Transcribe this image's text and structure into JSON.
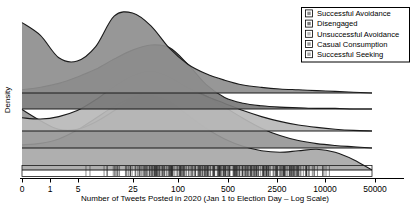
{
  "chart_data": {
    "type": "area",
    "subtype": "ridgeline-joyplot",
    "title": "",
    "xlabel": "Number of Tweets Posted in 2020 (Jan 1 to Election Day – Log Scale)",
    "ylabel": "Density",
    "grid": false,
    "legend_position": "top-right",
    "x_scale": "log",
    "x_tick_labels": [
      "0",
      "1",
      "5",
      "25",
      "100",
      "500",
      "2500",
      "10000",
      "50000"
    ],
    "x_tick_values": [
      0,
      1,
      5,
      25,
      100,
      500,
      2500,
      10000,
      50000
    ],
    "x_tick_px": [
      22,
      50,
      78,
      133,
      178,
      228,
      277,
      325,
      375
    ],
    "series": [
      {
        "name": "Successful Avoidance",
        "color": "#8e8e8e",
        "baseline_px": 93,
        "peak_labels": [
          "0",
          "5"
        ],
        "description": "Bimodal: tall mode at 0 tweets, taller mode near 5 tweets, long thin right tail past 500",
        "values": [
          0.88,
          0.72,
          0.44,
          0.4,
          0.58,
          0.96,
          1.0,
          0.84,
          0.56,
          0.36,
          0.24,
          0.16,
          0.1,
          0.07,
          0.05,
          0.04,
          0.03,
          0.02,
          0.01,
          0.0
        ]
      },
      {
        "name": "Disengaged",
        "color": "#7a7a7a",
        "baseline_px": 109,
        "peak_labels": [
          "25"
        ],
        "description": "Broad single mode rising from 0 to a peak near 20-25 tweets then falling to near zero by 200",
        "values": [
          0.3,
          0.34,
          0.4,
          0.5,
          0.62,
          0.78,
          0.92,
          1.0,
          0.96,
          0.7,
          0.38,
          0.18,
          0.09,
          0.05,
          0.03,
          0.02,
          0.01,
          0.01,
          0.0,
          0.0
        ]
      },
      {
        "name": "Unsuccessful Avoidance",
        "color": "#b9b9b9",
        "baseline_px": 131,
        "peak_labels": [
          "25"
        ],
        "description": "Low flat start, wide plateau peaking near 25, slow decay with a shoulder to 1000",
        "values": [
          0.22,
          0.2,
          0.24,
          0.34,
          0.52,
          0.74,
          0.92,
          1.0,
          0.9,
          0.72,
          0.58,
          0.46,
          0.34,
          0.24,
          0.16,
          0.1,
          0.06,
          0.03,
          0.01,
          0.0
        ]
      },
      {
        "name": "Casual Consumption",
        "color": "#979797",
        "baseline_px": 148,
        "peak_labels": [
          "0",
          "100"
        ],
        "description": "Mode at 0, dip near 3, broad second mode around 80-200, long tail to 5000",
        "values": [
          0.62,
          0.44,
          0.3,
          0.3,
          0.42,
          0.6,
          0.8,
          0.94,
          1.0,
          0.96,
          0.84,
          0.66,
          0.48,
          0.32,
          0.2,
          0.12,
          0.07,
          0.04,
          0.02,
          0.0
        ]
      },
      {
        "name": "Successful Seeking",
        "color": "#a8a8a8",
        "baseline_px": 170,
        "peak_labels": [
          "25",
          "5000"
        ],
        "description": "Rises to a mode near 25-50, declines through 500, small secondary bump near 5000",
        "values": [
          0.34,
          0.36,
          0.42,
          0.54,
          0.7,
          0.86,
          0.98,
          1.0,
          0.92,
          0.74,
          0.56,
          0.42,
          0.32,
          0.26,
          0.24,
          0.26,
          0.28,
          0.24,
          0.14,
          0.0
        ]
      }
    ],
    "rug": {
      "present": true,
      "description": "Dense rug of individual observation tick marks along the bottom axis, heaviest between 10 and 1000 tweets"
    }
  },
  "legend": {
    "items": [
      {
        "label": "Successful Avoidance",
        "color": "#8e8e8e"
      },
      {
        "label": "Disengaged",
        "color": "#7a7a7a"
      },
      {
        "label": "Unsuccessful Avoidance",
        "color": "#b9b9b9"
      },
      {
        "label": "Casual Consumption",
        "color": "#979797"
      },
      {
        "label": "Successful Seeking",
        "color": "#a8a8a8"
      }
    ]
  },
  "axes": {
    "x_title": "Number of Tweets Posted in 2020 (Jan 1 to Election Day – Log Scale)",
    "y_title": "Density",
    "x_ticks": [
      "0",
      "1",
      "5",
      "25",
      "100",
      "500",
      "2500",
      "10000",
      "50000"
    ]
  }
}
